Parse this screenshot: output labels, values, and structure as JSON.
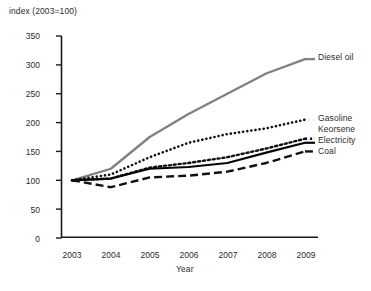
{
  "chart_data": {
    "type": "line",
    "title": "",
    "ylabel": "index (2003=100)",
    "xlabel": "Year",
    "x": [
      2003,
      2004,
      2005,
      2006,
      2007,
      2008,
      2009
    ],
    "xtick_labels": [
      "2003",
      "2004",
      "2005",
      "2006",
      "2007",
      "2008",
      "2009"
    ],
    "ytick_labels": [
      "0",
      "50",
      "100",
      "150",
      "200",
      "250",
      "300",
      "350"
    ],
    "yticks": [
      0,
      50,
      100,
      150,
      200,
      250,
      300,
      350
    ],
    "ylim": [
      0,
      350
    ],
    "xlim": [
      2003,
      2009
    ],
    "grid": false,
    "legend_position": "right-inline-labels",
    "series": [
      {
        "name": "Diesel oil",
        "values": [
          100,
          120,
          175,
          215,
          250,
          285,
          310
        ],
        "style": "solid",
        "color": "#808080",
        "width": 2.3
      },
      {
        "name": "Gasoline",
        "values": [
          100,
          110,
          140,
          165,
          180,
          190,
          205
        ],
        "style": "dotted-large",
        "color": "#111111",
        "width": 2.6
      },
      {
        "name": "Keorsene",
        "values": [
          100,
          103,
          122,
          130,
          140,
          155,
          172
        ],
        "style": "dotted-small",
        "color": "#111111",
        "width": 2.4
      },
      {
        "name": "Electricity",
        "values": [
          100,
          103,
          120,
          123,
          130,
          148,
          165
        ],
        "style": "solid",
        "color": "#050505",
        "width": 2.2
      },
      {
        "name": "Coal",
        "values": [
          100,
          88,
          105,
          108,
          115,
          130,
          150
        ],
        "style": "dashed",
        "color": "#111111",
        "width": 2.4
      }
    ]
  },
  "labels": {
    "diesel_oil": "Diesel oil",
    "gasoline": "Gasoline",
    "keorsene": "Keorsene",
    "electricity": "Electricity",
    "coal": "Coal"
  },
  "axis": {
    "y_title": "index (2003=100)",
    "x_title": "Year"
  },
  "ticks": {
    "y": [
      "350",
      "300",
      "250",
      "200",
      "150",
      "100",
      "50",
      "0"
    ],
    "x": [
      "2003",
      "2004",
      "2005",
      "2006",
      "2007",
      "2008",
      "2009"
    ]
  }
}
